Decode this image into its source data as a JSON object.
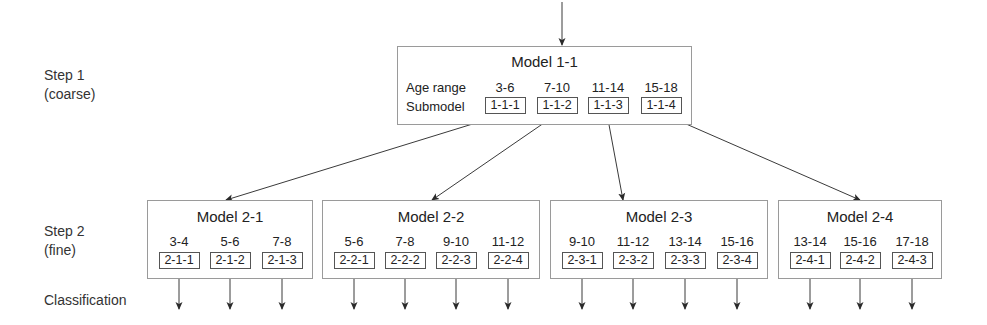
{
  "labels": {
    "step1": "Step 1",
    "step1_sub": "(coarse)",
    "step2": "Step 2",
    "step2_sub": "(fine)",
    "classification": "Classification"
  },
  "coarse_model": {
    "title": "Model 1-1",
    "age_range_label": "Age range",
    "submodel_label": "Submodel",
    "ranges": [
      "3-6",
      "7-10",
      "11-14",
      "15-18"
    ],
    "submodels": [
      "1-1-1",
      "1-1-2",
      "1-1-3",
      "1-1-4"
    ]
  },
  "fine_models": [
    {
      "title": "Model 2-1",
      "ranges": [
        "3-4",
        "5-6",
        "7-8"
      ],
      "submodels": [
        "2-1-1",
        "2-1-2",
        "2-1-3"
      ]
    },
    {
      "title": "Model 2-2",
      "ranges": [
        "5-6",
        "7-8",
        "9-10",
        "11-12"
      ],
      "submodels": [
        "2-2-1",
        "2-2-2",
        "2-2-3",
        "2-2-4"
      ]
    },
    {
      "title": "Model 2-3",
      "ranges": [
        "9-10",
        "11-12",
        "13-14",
        "15-16"
      ],
      "submodels": [
        "2-3-1",
        "2-3-2",
        "2-3-3",
        "2-3-4"
      ]
    },
    {
      "title": "Model 2-4",
      "ranges": [
        "13-14",
        "15-16",
        "17-18"
      ],
      "submodels": [
        "2-4-1",
        "2-4-2",
        "2-4-3"
      ]
    }
  ],
  "colors": {
    "line": "#3a3a3a",
    "box_border": "#9a9a9a",
    "sub_border": "#555555"
  }
}
